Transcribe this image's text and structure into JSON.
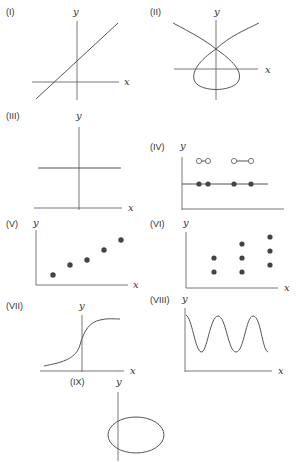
{
  "panels": [
    {
      "id": "I",
      "label": "(I)",
      "xlabel": "x",
      "ylabel": "y",
      "kind": "straight line with positive slope"
    },
    {
      "id": "II",
      "label": "(II)",
      "xlabel": "x",
      "ylabel": "y",
      "kind": "self-intersecting loop curve (cubic-like node)"
    },
    {
      "id": "III",
      "label": "(III)",
      "xlabel": "x",
      "ylabel": "y",
      "kind": "horizontal line (constant function)"
    },
    {
      "id": "IV",
      "label": "(IV)",
      "xlabel": "",
      "ylabel": "y",
      "kind": "step function with open and closed points"
    },
    {
      "id": "V",
      "label": "(V)",
      "xlabel": "x",
      "ylabel": "y",
      "kind": "scatter of increasing points"
    },
    {
      "id": "VI",
      "label": "(VI)",
      "xlabel": "x",
      "ylabel": "y",
      "kind": "scatter of vertical point columns"
    },
    {
      "id": "VII",
      "label": "(VII)",
      "xlabel": "x",
      "ylabel": "y",
      "kind": "sigmoid curve"
    },
    {
      "id": "VIII",
      "label": "(VIII)",
      "xlabel": "x",
      "ylabel": "y",
      "kind": "sinusoidal wave"
    },
    {
      "id": "IX",
      "label": "(IX)",
      "xlabel": "",
      "ylabel": "y",
      "kind": "ellipse"
    }
  ],
  "colors": {
    "stroke": "#555555",
    "point": "#444444",
    "background": "#ffffff"
  }
}
